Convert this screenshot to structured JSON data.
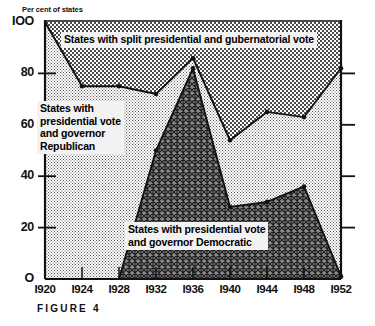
{
  "figure": {
    "caption": "FIGURE 4",
    "y_axis_title": "Per cent of states"
  },
  "labels": {
    "split": "States with split presidential and gubernatorial vote",
    "republican": "States with\npresidential vote\nand governor\nRepublican",
    "democratic": "States with presidential vote\nand governor  Democratic"
  },
  "colors": {
    "split_fill": "#d8d8d8",
    "republican_fill": "#c9c9c9",
    "democratic_fill": "#6f6f6f",
    "line": "#111111",
    "axis": "#111111",
    "callout_bg": "#f2f2f2"
  },
  "chart_data": {
    "type": "area",
    "title": "",
    "subtitle": "",
    "xlabel": "",
    "ylabel": "Per cent of states",
    "categories": [
      "1920",
      "1924",
      "1928",
      "1932",
      "1936",
      "1940",
      "1944",
      "1948",
      "1952"
    ],
    "x": [
      1920,
      1924,
      1928,
      1932,
      1936,
      1940,
      1944,
      1948,
      1952
    ],
    "xlim": [
      1920,
      1952
    ],
    "ylim": [
      0,
      100
    ],
    "yticks": [
      0,
      20,
      40,
      60,
      80,
      100
    ],
    "xticks": [
      "1920",
      "1924",
      "1928",
      "1932",
      "1936",
      "1940",
      "1944",
      "1948",
      "1952"
    ],
    "grid": false,
    "legend": "inline-annotations",
    "series": [
      {
        "name": "States with presidential vote and governor Democratic",
        "role": "lower-boundary",
        "values": [
          0,
          0,
          0,
          50,
          82,
          28,
          30,
          36,
          1
        ]
      },
      {
        "name": "States with presidential vote and governor Republican (cumulative upper boundary)",
        "role": "upper-boundary",
        "values": [
          100,
          75,
          75,
          72,
          86,
          54,
          65,
          63,
          82
        ]
      }
    ],
    "bands": [
      {
        "name": "States with split presidential and gubernatorial vote",
        "from": "upper-boundary",
        "to": 100,
        "fill": "#d8d8d8"
      },
      {
        "name": "States with presidential vote and governor Republican",
        "from": "lower-boundary",
        "to": "upper-boundary",
        "fill": "#c9c9c9"
      },
      {
        "name": "States with presidential vote and governor Democratic",
        "from": 0,
        "to": "lower-boundary",
        "fill": "#6f6f6f"
      }
    ]
  }
}
